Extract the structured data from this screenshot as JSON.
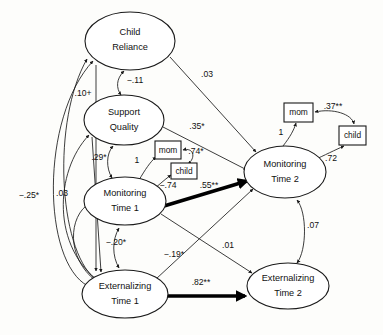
{
  "figure": {
    "type": "path-diagram",
    "title": "",
    "background_color": "#fdfdfb",
    "line_color": "#1a1a1a"
  },
  "nodes": {
    "latent": [
      {
        "id": "child_reliance",
        "line1": "Child",
        "line2": "Reliance",
        "shape": "ellipse",
        "cx": 130,
        "cy": 41,
        "rx": 45,
        "ry": 29
      },
      {
        "id": "support_quality",
        "line1": "Support",
        "line2": "Quality",
        "shape": "ellipse",
        "cx": 124,
        "cy": 120,
        "rx": 40,
        "ry": 25
      },
      {
        "id": "monitoring_t1",
        "line1": "Monitoring",
        "line2": "Time 1",
        "shape": "ellipse",
        "cx": 125,
        "cy": 201,
        "rx": 41,
        "ry": 24
      },
      {
        "id": "externalizing_t1",
        "line1": "Externalizing",
        "line2": "Time 1",
        "shape": "ellipse",
        "cx": 125,
        "cy": 294,
        "rx": 43,
        "ry": 24
      },
      {
        "id": "monitoring_t2",
        "line1": "Monitoring",
        "line2": "Time 2",
        "shape": "ellipse",
        "cx": 285,
        "cy": 172,
        "rx": 41,
        "ry": 26
      },
      {
        "id": "externalizing_t2",
        "line1": "Externalizing",
        "line2": "Time 2",
        "shape": "ellipse",
        "cx": 288,
        "cy": 286,
        "rx": 41,
        "ry": 23
      }
    ],
    "indicators": [
      {
        "id": "mom_t1",
        "label": "mom",
        "shape": "rect",
        "x": 155,
        "y": 141,
        "w": 26,
        "h": 18
      },
      {
        "id": "child_t1",
        "label": "child",
        "shape": "rect",
        "x": 171,
        "y": 163,
        "w": 26,
        "h": 16
      },
      {
        "id": "mom_t2",
        "label": "mom",
        "shape": "rect",
        "x": 284,
        "y": 103,
        "w": 29,
        "h": 19
      },
      {
        "id": "child_t2",
        "label": "child",
        "shape": "rect",
        "x": 339,
        "y": 126,
        "w": 27,
        "h": 19
      }
    ]
  },
  "coefficients": [
    {
      "id": "cr_sq_cov",
      "value": "−.11",
      "x": 135,
      "y": 81,
      "relation": "Child Reliance <-> Support Quality"
    },
    {
      "id": "cr_mt2_path",
      "value": ".03",
      "x": 207,
      "y": 75,
      "relation": "Child Reliance -> Monitoring Time 2"
    },
    {
      "id": "ext1_cr_path",
      "value": ".10+",
      "x": 83,
      "y": 94,
      "relation": "Externalizing Time 1 -> Child Reliance"
    },
    {
      "id": "sq_mt2_path",
      "value": ".35*",
      "x": 197,
      "y": 127,
      "relation": "Support Quality -> Monitoring Time 2"
    },
    {
      "id": "sq_mt1_cov",
      "value": ".29*",
      "x": 99,
      "y": 158,
      "relation": "Support Quality <-> Monitoring Time 1"
    },
    {
      "id": "mt1_mom_load",
      "value": "1",
      "x": 137,
      "y": 161,
      "relation": "Monitoring Time 1 -> mom"
    },
    {
      "id": "mom_child_t1_cov",
      "value": ".74*",
      "x": 196,
      "y": 152,
      "relation": "mom <-> child (Time 1)"
    },
    {
      "id": "mt1_child_load",
      "value": "−.74",
      "x": 168,
      "y": 186,
      "relation": "Monitoring Time 1 -> child"
    },
    {
      "id": "mt1_mt2_path",
      "value": ".55**",
      "x": 209,
      "y": 186,
      "relation": "Monitoring Time 1 -> Monitoring Time 2",
      "bold": true
    },
    {
      "id": "mt2_mom_load",
      "value": "1",
      "x": 281,
      "y": 133,
      "relation": "Monitoring Time 2 -> mom"
    },
    {
      "id": "mom_child_t2_cov",
      "value": ".37**",
      "x": 333,
      "y": 107,
      "relation": "mom <-> child (Time 2)"
    },
    {
      "id": "mt2_child_load",
      "value": ".72",
      "x": 331,
      "y": 159,
      "relation": "Monitoring Time 2 -> child"
    },
    {
      "id": "ext1_ext2_path",
      "value": ".82**",
      "x": 201,
      "y": 283,
      "relation": "Externalizing Time 1 -> Externalizing Time 2",
      "bold": true
    },
    {
      "id": "mt1_ext1_cov",
      "value": "−.20*",
      "x": 116,
      "y": 243,
      "relation": "Monitoring Time 1 <-> Externalizing Time 1"
    },
    {
      "id": "ext1_mt2_path",
      "value": "−.19*",
      "x": 174,
      "y": 255,
      "relation": "Externalizing Time 1 -> Monitoring Time 2"
    },
    {
      "id": "mt1_ext2_path",
      "value": ".01",
      "x": 228,
      "y": 246,
      "relation": "Monitoring Time 1 -> Externalizing Time 2"
    },
    {
      "id": "mt2_ext2_cov",
      "value": ".07",
      "x": 313,
      "y": 226,
      "relation": "Monitoring Time 2 <-> Externalizing Time 2"
    },
    {
      "id": "ext1_sq_path",
      "value": "−.25*",
      "x": 29,
      "y": 196,
      "relation": "Externalizing Time 1 -> Support Quality"
    },
    {
      "id": "ext1_mt1_path",
      "value": ".03",
      "x": 62,
      "y": 194,
      "relation": "Externalizing Time 1 -> Monitoring Time 1"
    }
  ],
  "legend": {
    "significance_markers": [
      "+",
      "*",
      "**"
    ]
  }
}
